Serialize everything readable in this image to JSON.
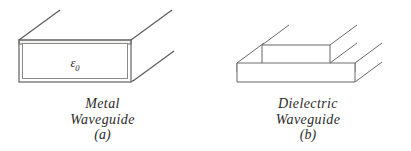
{
  "figure": {
    "background_color": "#ffffff",
    "line_color": "#555555",
    "text_color": "#2b2b2b",
    "panels": [
      {
        "id": "a",
        "tag": "(a)",
        "caption_line1": "Metal",
        "caption_line2": "Waveguide",
        "permittivity_symbol": "ε",
        "permittivity_subscript": "0",
        "permittivity_prefix": "",
        "cross_section": "hollow rectangular box with conducting walls",
        "wall_style": "double-line"
      },
      {
        "id": "b",
        "tag": "(b)",
        "caption_line1": "Dielectric",
        "caption_line2": "Waveguide",
        "permittivity_symbol": "ε",
        "permittivity_subscript": "0",
        "permittivity_prefix_symbol": "ε",
        "permittivity_prefix_subscript": "r",
        "cross_section": "raised dielectric ridge on a slab base",
        "wall_style": "single-line"
      }
    ]
  }
}
